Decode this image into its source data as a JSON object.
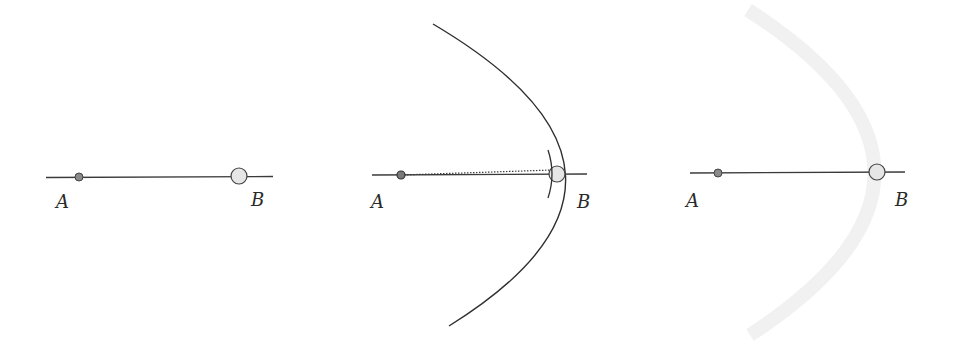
{
  "panels": [
    {
      "id": "panel-1",
      "line": {
        "x1": 46,
        "y1": 177.5,
        "x2": 273,
        "y2": 176.5
      },
      "point_a": {
        "cx": 79,
        "cy": 177,
        "r": 4,
        "label": "A",
        "label_x": 56,
        "label_y": 208
      },
      "point_b": {
        "cx": 239,
        "cy": 176,
        "r": 8,
        "label": "B",
        "label_x": 251,
        "label_y": 206
      }
    },
    {
      "id": "panel-2",
      "line": {
        "x1": 372,
        "y1": 175,
        "x2": 587,
        "y2": 174
      },
      "dotted_line": {
        "x1": 401,
        "y1": 175,
        "x2": 553,
        "y2": 170
      },
      "arc": {
        "start_x": 433,
        "start_y": 24,
        "ctrl_x": 690,
        "ctrl_y": 176,
        "end_x": 449,
        "end_y": 326
      },
      "point_a": {
        "cx": 401,
        "cy": 175,
        "r": 4,
        "label": "A",
        "label_x": 371,
        "label_y": 208
      },
      "point_b": {
        "cx": 557,
        "cy": 174,
        "r": 8,
        "label": "B",
        "label_x": 577,
        "label_y": 208
      }
    },
    {
      "id": "panel-3",
      "line": {
        "x1": 690,
        "y1": 173,
        "x2": 905,
        "y2": 172
      },
      "faint_arc": {
        "start_x": 748,
        "start_y": 10,
        "ctrl_x": 1000,
        "ctrl_y": 172,
        "end_x": 750,
        "end_y": 335
      },
      "point_a": {
        "cx": 718,
        "cy": 173,
        "r": 4,
        "label": "A",
        "label_x": 686,
        "label_y": 207
      },
      "point_b": {
        "cx": 877,
        "cy": 172,
        "r": 8,
        "label": "B",
        "label_x": 895,
        "label_y": 206
      }
    }
  ],
  "colors": {
    "line": "#3a3a3a",
    "small_dot_fill": "#8a8a8a",
    "large_dot_fill": "#e6e6e6",
    "arc": "#2e2e2e",
    "faint_arc": "#f1f1f1"
  }
}
